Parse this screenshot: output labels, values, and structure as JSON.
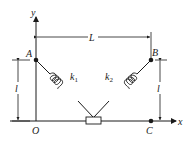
{
  "diagram": {
    "labels": {
      "y_axis": "y",
      "x_axis": "x",
      "origin": "O",
      "point_a": "A",
      "point_b": "B",
      "point_c": "C",
      "span": "L",
      "height_left": "l",
      "height_right": "l",
      "spring_1": "k",
      "spring_1_sub": "1",
      "spring_2": "k",
      "spring_2_sub": "2"
    },
    "colors": {
      "ink": "#1a1a1a",
      "background": "#ffffff"
    }
  }
}
